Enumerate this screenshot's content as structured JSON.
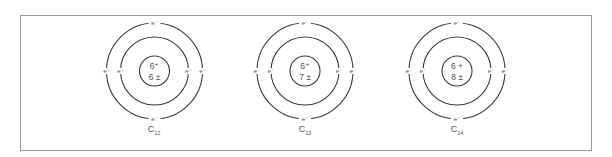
{
  "figure": {
    "atoms": [
      {
        "id": "carbon-12",
        "center": [
          154.5,
          71
        ],
        "nucleus": {
          "protons": "6",
          "proton_sign": "⁺",
          "neutrons": "6",
          "neutron_sign": "±"
        },
        "label": {
          "symbol": "C",
          "mass": "12"
        },
        "electrons": [
          "e⁻",
          "e⁻",
          "e⁻",
          "e⁻",
          "e⁻",
          "e⁻"
        ]
      },
      {
        "id": "carbon-13",
        "center": [
          305,
          71
        ],
        "nucleus": {
          "protons": "6",
          "proton_sign": "⁺",
          "neutrons": "7",
          "neutron_sign": "±"
        },
        "label": {
          "symbol": "C",
          "mass": "13"
        },
        "electrons": [
          "e⁻",
          "e⁻",
          "e⁻",
          "e⁻",
          "e⁻",
          "e⁻"
        ]
      },
      {
        "id": "carbon-14",
        "center": [
          457,
          71
        ],
        "nucleus": {
          "protons": "6",
          "proton_sign": "+",
          "neutrons": "8",
          "neutron_sign": "±"
        },
        "label": {
          "symbol": "C",
          "mass": "14"
        },
        "electrons": [
          "e⁻",
          "e⁻",
          "e⁻",
          "e⁻",
          "e⁻",
          "e⁻"
        ]
      }
    ],
    "orbits": {
      "outer_radius": 48,
      "inner_radius": 34,
      "nucleus_radius": 15
    },
    "colors": {
      "line": "#3a3a3a",
      "text": "#555555",
      "frame": "#9a9a9a"
    }
  },
  "atom0": {
    "n_top": "6⁺",
    "n_bot": "6 ±",
    "e_top": "e⁻",
    "e_bot": "e⁻",
    "e_ol": "e⁻",
    "e_il": "e⁻",
    "e_ir": "e⁻",
    "e_or": "e⁻",
    "sym": "C",
    "mass": "12"
  },
  "atom1": {
    "n_top": "6⁺",
    "n_bot": "7 ±",
    "e_top": "e⁻",
    "e_bot": "e⁻",
    "e_ol": "e⁻",
    "e_il": "e⁻",
    "e_ir": "e⁻",
    "e_or": "e⁻",
    "sym": "C",
    "mass": "13"
  },
  "atom2": {
    "n_top": "6 +",
    "n_bot": "8 ±",
    "e_top": "e⁻",
    "e_bot": "e⁻",
    "e_ol": "e⁻",
    "e_il": "e⁻",
    "e_ir": "e⁻",
    "e_or": "e⁻",
    "sym": "C",
    "mass": "14"
  }
}
